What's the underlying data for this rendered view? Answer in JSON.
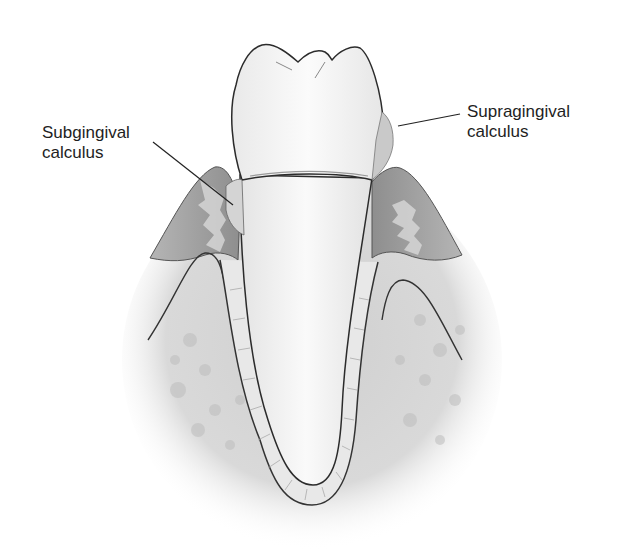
{
  "figure": {
    "labels": [
      {
        "id": "subgingival",
        "line1": "Subgingival",
        "line2": "calculus"
      },
      {
        "id": "supragingival",
        "line1": "Supragingival",
        "line2": "calculus"
      }
    ],
    "colors": {
      "outline": "#2b2b2b",
      "enamel": "#f7f7f7",
      "gingiva": "#9a9a9a",
      "bone": "#d4d4d4",
      "calculus": "#c9c9c9",
      "background": "#ffffff"
    }
  }
}
